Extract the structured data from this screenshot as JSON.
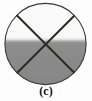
{
  "figure": {
    "caption": "(c)",
    "kind": "circle-with-inscribed-x",
    "canvas": {
      "width": 92,
      "height": 101
    },
    "background_color": "#fdfdfd",
    "circle": {
      "center_x": 45.5,
      "center_y": 44.0,
      "radius": 41.0,
      "outline_color": "#3a3734",
      "outline_width": 1.1
    },
    "shading": {
      "upper_fill_color": "#fafafa",
      "lower_fill_color": "#8a8a8a",
      "transition_start_y": 37,
      "transition_end_y": 44,
      "midline_y": 42
    },
    "cross_lines": [
      {
        "name": "diagonal-nw-se",
        "x1": 15.5,
        "y1": 14.0,
        "x2": 76.0,
        "y2": 74.5,
        "color": "#2b2926",
        "width": 2.0
      },
      {
        "name": "diagonal-ne-sw",
        "x1": 76.0,
        "y1": 14.0,
        "x2": 15.5,
        "y2": 74.5,
        "color": "#2b2926",
        "width": 2.0
      }
    ],
    "sectors": [
      {
        "name": "top-sector",
        "shade": "light"
      },
      {
        "name": "left-sector",
        "shade": "mixed"
      },
      {
        "name": "right-sector",
        "shade": "mixed"
      },
      {
        "name": "bottom-sector",
        "shade": "dark"
      }
    ]
  }
}
